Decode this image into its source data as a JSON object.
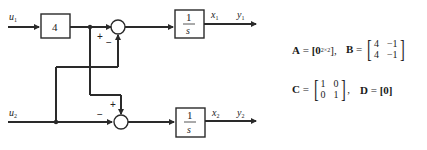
{
  "diagram": {
    "inputs": [
      {
        "id": "u1",
        "label": "u",
        "sub": "1"
      },
      {
        "id": "u2",
        "label": "u",
        "sub": "2"
      }
    ],
    "gain_block": {
      "label": "4"
    },
    "integrators": [
      {
        "num": "1",
        "den": "s",
        "state": "x",
        "state_sub": "1",
        "output": "y",
        "output_sub": "1"
      },
      {
        "num": "1",
        "den": "s",
        "state": "x",
        "state_sub": "2",
        "output": "y",
        "output_sub": "2"
      }
    ],
    "summers": [
      {
        "signs": {
          "left": "+",
          "bottom": "−"
        }
      },
      {
        "signs": {
          "top": "+",
          "left": "−"
        }
      }
    ]
  },
  "equations": {
    "A": {
      "name": "A",
      "eq": "=",
      "value": "[0",
      "sub": "2×2",
      "close": "],"
    },
    "B": {
      "name": "B",
      "eq": "=",
      "rows": [
        [
          "4",
          "−1"
        ],
        [
          "4",
          "−1"
        ]
      ]
    },
    "C": {
      "name": "C",
      "eq": "=",
      "rows": [
        [
          "1",
          "0"
        ],
        [
          "0",
          "1"
        ]
      ],
      "trail": ","
    },
    "D": {
      "name": "D",
      "eq": "=",
      "value": "[0]"
    }
  },
  "colors": {
    "line": "#2a2a2a",
    "background": "#ffffff"
  }
}
